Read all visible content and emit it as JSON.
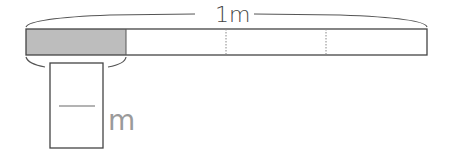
{
  "diagram": {
    "total_label": "1m",
    "unit_label": "m",
    "segments": 4,
    "shaded_segments": 1,
    "answer_box": {
      "type": "fraction",
      "numerator": "",
      "denominator": ""
    },
    "colors": {
      "shaded": "#bdbdbd",
      "outline": "#444444",
      "divider": "#888888",
      "fraction_line": "#9a9a9a"
    }
  }
}
